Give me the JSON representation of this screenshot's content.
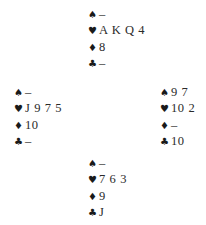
{
  "diagram": {
    "type": "bridge-deal",
    "suit_symbols": {
      "spades": "♠",
      "hearts": "♥",
      "diamonds": "♦",
      "clubs": "♣"
    },
    "hands": {
      "north": {
        "spades": "–",
        "hearts": "A K Q 4",
        "diamonds": "8",
        "clubs": "–"
      },
      "west": {
        "spades": "–",
        "hearts": "J 9 7 5",
        "diamonds": "10",
        "clubs": "–"
      },
      "east": {
        "spades": "9 7",
        "hearts": "10 2",
        "diamonds": "–",
        "clubs": "10"
      },
      "south": {
        "spades": "–",
        "hearts": "7 6 3",
        "diamonds": "9",
        "clubs": "J"
      }
    }
  }
}
